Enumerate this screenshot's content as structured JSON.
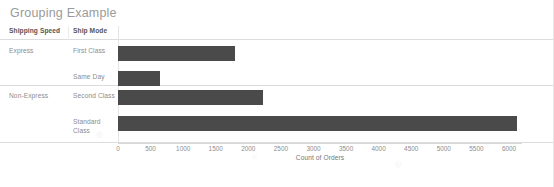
{
  "title": "Grouping Example",
  "table_headers": {
    "shipping_speed": "Shipping Speed",
    "ship_mode": "Ship Mode",
    "sort_indicator": "↑",
    "sort_icon_name": "sort-ascending-icon"
  },
  "rows": [
    {
      "group": "Express",
      "mode": "First Class",
      "value": 1790
    },
    {
      "group": "",
      "mode": "Same Day",
      "value": 650
    },
    {
      "group": "Non-Express",
      "mode": "Second Class",
      "value": 2230
    },
    {
      "group": "",
      "mode": "Standard Class",
      "value": 6120
    }
  ],
  "axis": {
    "title": "Count of Orders",
    "ticks": [
      "0",
      "500",
      "1000",
      "1500",
      "2000",
      "2500",
      "3000",
      "3500",
      "4000",
      "4500",
      "5000",
      "5500",
      "6000"
    ]
  },
  "colors": {
    "bar": "#4a4a4a",
    "title_text": "#9a9a9a",
    "header_text": "#555555",
    "label_text": "#8c8c8c",
    "grid_line": "#dcdcdc",
    "background": "#ffffff"
  },
  "chart_data": {
    "type": "bar",
    "orientation": "horizontal",
    "title": "Grouping Example",
    "xlabel": "Count of Orders",
    "ylabel": "",
    "categories": [
      "First Class",
      "Same Day",
      "Second Class",
      "Standard Class"
    ],
    "groups": [
      "Express",
      "Express",
      "Non-Express",
      "Non-Express"
    ],
    "values": [
      1790,
      650,
      2230,
      6120
    ],
    "xlim": [
      0,
      6200
    ],
    "xticks": [
      0,
      500,
      1000,
      1500,
      2000,
      2500,
      3000,
      3500,
      4000,
      4500,
      5000,
      5500,
      6000
    ],
    "grid": false,
    "legend": false,
    "series": [
      {
        "name": "Count of Orders",
        "values": [
          1790,
          650,
          2230,
          6120
        ]
      }
    ]
  }
}
